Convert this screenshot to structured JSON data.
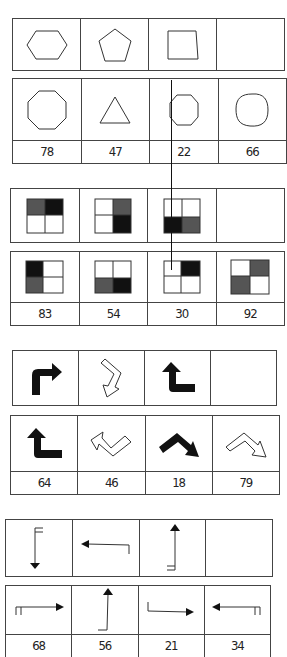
{
  "puzzles": [
    {
      "id": "shapes",
      "sequence": [
        "hexagon",
        "pentagon",
        "square",
        "blank"
      ],
      "options": [
        {
          "figure": "octagon",
          "code": "78"
        },
        {
          "figure": "triangle",
          "code": "47"
        },
        {
          "figure": "heptagon",
          "code": "22"
        },
        {
          "figure": "circle",
          "code": "66"
        }
      ]
    },
    {
      "id": "quadrant-squares",
      "sequence": [
        "top-shaded",
        "right-shaded",
        "bottom-shaded",
        "blank"
      ],
      "options": [
        {
          "figure": "left-shaded",
          "code": "83"
        },
        {
          "figure": "bottom-shaded",
          "code": "54"
        },
        {
          "figure": "top-right-shaded",
          "code": "30"
        },
        {
          "figure": "diagonal-shaded",
          "code": "92"
        }
      ]
    },
    {
      "id": "bent-arrows",
      "sequence": [
        "solid-up-right",
        "outline-down-left",
        "solid-up-left",
        "blank"
      ],
      "options": [
        {
          "figure": "solid-up-left",
          "code": "64"
        },
        {
          "figure": "outline-left-v",
          "code": "46"
        },
        {
          "figure": "solid-down-right-hump",
          "code": "18"
        },
        {
          "figure": "outline-right-hump",
          "code": "79"
        }
      ]
    },
    {
      "id": "line-arrows",
      "sequence": [
        "arrow-down-tail-top",
        "arrow-left-tail-right",
        "arrow-up-tail-bottom",
        "blank"
      ],
      "options": [
        {
          "figure": "arrow-right-tail-left",
          "code": "68"
        },
        {
          "figure": "arrow-up-tail-left",
          "code": "56"
        },
        {
          "figure": "arrow-right-tail-up",
          "code": "21"
        },
        {
          "figure": "arrow-left-tail-right",
          "code": "34"
        }
      ]
    }
  ],
  "colors": {
    "line": "#333333",
    "dark_fill": "#111111",
    "gray_fill": "#555555",
    "background": "#ffffff"
  }
}
